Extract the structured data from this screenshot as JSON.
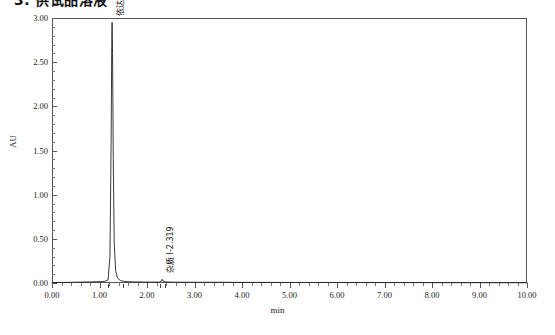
{
  "title": "3. 供试品溶液",
  "chart_data": {
    "type": "line",
    "title": "3. 供试品溶液",
    "xlabel": "min",
    "ylabel": "AU",
    "xlim": [
      0.0,
      10.0
    ],
    "ylim": [
      0.0,
      3.0
    ],
    "grid": false,
    "legend": "none",
    "x_ticks": [
      "0.00",
      "1.00",
      "2.00",
      "3.00",
      "4.00",
      "5.00",
      "6.00",
      "7.00",
      "8.00",
      "9.00",
      "10.00"
    ],
    "x_tick_values": [
      0,
      1,
      2,
      3,
      4,
      5,
      6,
      7,
      8,
      9,
      10
    ],
    "x_minor_per_major": 5,
    "y_ticks": [
      "0.00",
      "0.50",
      "1.00",
      "1.50",
      "2.00",
      "2.50",
      "3.00"
    ],
    "y_tick_values": [
      0.0,
      0.5,
      1.0,
      1.5,
      2.0,
      2.5,
      3.0
    ],
    "y_minor_per_major": 5,
    "series": [
      {
        "name": "chromatogram",
        "color": "#222222",
        "points": [
          [
            0.0,
            0.005
          ],
          [
            0.2,
            0.006
          ],
          [
            0.4,
            0.008
          ],
          [
            0.6,
            0.01
          ],
          [
            0.8,
            0.012
          ],
          [
            0.95,
            0.014
          ],
          [
            1.05,
            0.016
          ],
          [
            1.12,
            0.02
          ],
          [
            1.18,
            0.035
          ],
          [
            1.22,
            0.3
          ],
          [
            1.245,
            1.6
          ],
          [
            1.258,
            2.7
          ],
          [
            1.265,
            2.95
          ],
          [
            1.275,
            2.6
          ],
          [
            1.29,
            1.4
          ],
          [
            1.31,
            0.45
          ],
          [
            1.34,
            0.14
          ],
          [
            1.38,
            0.055
          ],
          [
            1.44,
            0.028
          ],
          [
            1.52,
            0.018
          ],
          [
            1.62,
            0.014
          ],
          [
            1.75,
            0.012
          ],
          [
            1.9,
            0.011
          ],
          [
            2.1,
            0.01
          ],
          [
            2.26,
            0.01
          ],
          [
            2.3,
            0.018
          ],
          [
            2.319,
            0.042
          ],
          [
            2.34,
            0.02
          ],
          [
            2.4,
            0.011
          ],
          [
            2.6,
            0.009
          ],
          [
            3.0,
            0.008
          ],
          [
            3.5,
            0.008
          ],
          [
            4.0,
            0.007
          ],
          [
            4.5,
            0.007
          ],
          [
            5.0,
            0.006
          ],
          [
            5.5,
            0.006
          ],
          [
            6.0,
            0.006
          ],
          [
            6.5,
            0.005
          ],
          [
            7.0,
            0.005
          ],
          [
            7.5,
            0.005
          ],
          [
            8.0,
            0.004
          ],
          [
            8.5,
            0.004
          ],
          [
            9.0,
            0.004
          ],
          [
            9.5,
            0.003
          ],
          [
            10.0,
            0.003
          ]
        ]
      }
    ],
    "peaks": [
      {
        "name": "依达拉奉",
        "retention_time": "1.265",
        "label": "依达拉奉-1.265",
        "apex_y": 2.95,
        "integration_start": 1.17,
        "integration_end": 1.5
      },
      {
        "name": "杂质 I",
        "retention_time": "2.319",
        "label": "杂质 I-2.319",
        "apex_y": 0.042,
        "integration_start": 2.27,
        "integration_end": 2.38
      }
    ],
    "annotations": [
      {
        "text": "依达拉奉-1.265",
        "x": 1.265,
        "y": 2.95
      },
      {
        "text": "杂质 I-2.319",
        "x": 2.319,
        "y": 0.042
      }
    ]
  },
  "colors": {
    "trace": "#222222",
    "frame": "#555555",
    "background": "#ffffff",
    "text": "#1a1a1a"
  }
}
